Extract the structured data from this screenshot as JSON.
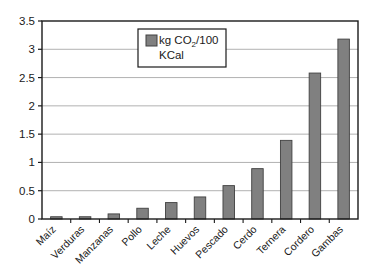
{
  "chart_data": {
    "type": "bar",
    "title": "",
    "xlabel": "",
    "ylabel": "",
    "ylim": [
      0,
      3.5
    ],
    "ytick_labels": [
      "0",
      "0.5",
      "1",
      "1.5",
      "2",
      "2.5",
      "3",
      "3.5"
    ],
    "ytick_values": [
      0,
      0.5,
      1,
      1.5,
      2,
      2.5,
      3,
      3.5
    ],
    "grid": true,
    "legend_position": "upper-center-left",
    "legend": [
      {
        "label": "kg CO2/100 KCal",
        "label_line1_prefix": "kg CO",
        "label_line1_subscript": "2",
        "label_line1_suffix": "/100",
        "label_line2": "KCal",
        "color": "#808080"
      }
    ],
    "categories": [
      "Maíz",
      "Verduras",
      "Manzanas",
      "Pollo",
      "Leche",
      "Huevos",
      "Pescado",
      "Cerdo",
      "Ternera",
      "Cordero",
      "Gambas"
    ],
    "values": [
      0.04,
      0.04,
      0.09,
      0.19,
      0.29,
      0.39,
      0.59,
      0.89,
      1.39,
      2.58,
      3.18
    ],
    "series": [
      {
        "name": "kg CO2/100 KCal",
        "values": [
          0.04,
          0.04,
          0.09,
          0.19,
          0.29,
          0.39,
          0.59,
          0.89,
          1.39,
          2.58,
          3.18
        ]
      }
    ]
  },
  "style": {
    "bar_fill": "#808080",
    "bar_stroke": "#404040",
    "axis_color": "#1a1a1a",
    "grid_color": "#a8a8a8",
    "plot_background": "#ffffff",
    "legend_border": "#1a1a1a"
  }
}
